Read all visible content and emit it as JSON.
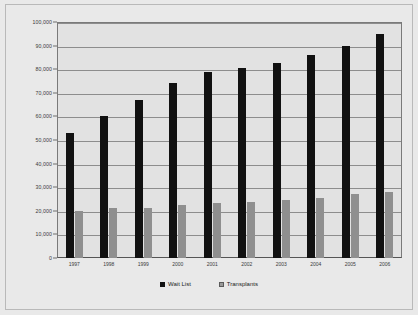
{
  "chart_data": {
    "type": "bar",
    "title": "",
    "subtitle": "",
    "xlabel": "",
    "ylabel": "",
    "grid": true,
    "legend_position": "bottom",
    "categories": [
      "1997",
      "1998",
      "1999",
      "2000",
      "2001",
      "2002",
      "2003",
      "2004",
      "2005",
      "2006"
    ],
    "ylim": [
      0,
      100000
    ],
    "ytick_labels": [
      "100,000",
      "90,000",
      "80,000",
      "70,000",
      "60,000",
      "50,000",
      "40,000",
      "30,000",
      "20,000",
      "10,000",
      "0"
    ],
    "ytick_values": [
      100000,
      90000,
      80000,
      70000,
      60000,
      50000,
      40000,
      30000,
      20000,
      10000,
      0
    ],
    "series": [
      {
        "name": "Wait List",
        "color": "#111111",
        "values": [
          53000,
          60000,
          67000,
          74000,
          79000,
          80500,
          82500,
          86000,
          90000,
          95000
        ]
      },
      {
        "name": "Transplants",
        "color": "#8f8f8f",
        "values": [
          20000,
          21000,
          21300,
          22500,
          23500,
          23800,
          24500,
          25500,
          27000,
          28000
        ]
      }
    ]
  },
  "legend": {
    "items": [
      {
        "label": "Wait List",
        "marker": "filled-square-black"
      },
      {
        "label": "Transplants",
        "marker": "hatched-square-gray"
      }
    ]
  }
}
